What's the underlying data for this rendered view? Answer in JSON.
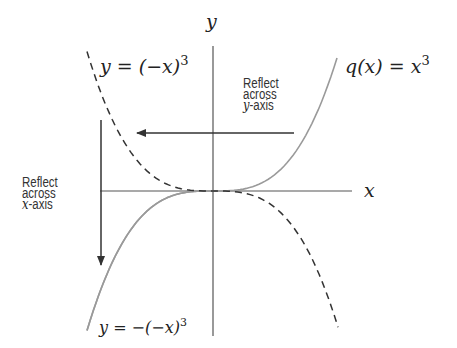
{
  "diagram": {
    "axes": {
      "x_label": "x",
      "y_label": "y",
      "origin_px": [
        213,
        191
      ]
    },
    "curves": [
      {
        "id": "original",
        "label": "q(x) = x^3",
        "label_parts": {
          "lhs": "q(x) = x",
          "exp": "3"
        },
        "style": "solid",
        "color": "#9a9a9a"
      },
      {
        "id": "reflect-y",
        "label": "y = (-x)^3",
        "label_parts": {
          "lhs": "y = (−x)",
          "exp": "3"
        },
        "style": "dashed",
        "color": "#333333"
      },
      {
        "id": "reflect-xy",
        "label": "y = -(-x)^3",
        "label_parts": {
          "lhs": "y = −(−x)",
          "exp": "3"
        },
        "style": "solid",
        "color": "#9a9a9a"
      }
    ],
    "annotations": {
      "reflect_y": {
        "line1": "Reflect",
        "line2": "across",
        "line3_var": "y",
        "line3_rest": "-axis"
      },
      "reflect_x": {
        "line1": "Reflect",
        "line2": "across",
        "line3_var": "x",
        "line3_rest": "-axis"
      }
    },
    "colors": {
      "axis": "#555555",
      "arrow": "#333333",
      "solid_curve": "#9a9a9a",
      "dashed_curve": "#333333"
    }
  }
}
